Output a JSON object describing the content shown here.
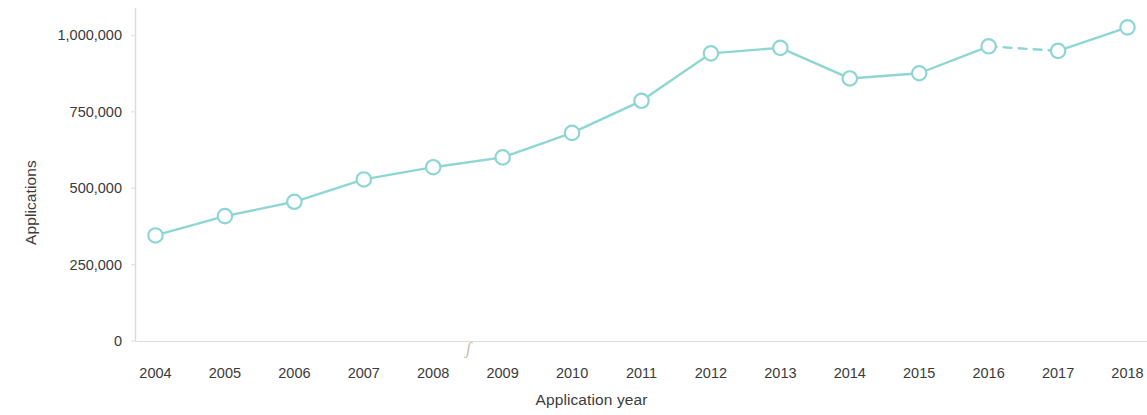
{
  "chart_data": {
    "type": "line",
    "title": "",
    "xlabel": "Application year",
    "ylabel": "Applications",
    "categories": [
      "2004",
      "2005",
      "2006",
      "2007",
      "2008",
      "2009",
      "2010",
      "2011",
      "2012",
      "2013",
      "2014",
      "2015",
      "2016",
      "2017",
      "2018"
    ],
    "x": [
      2004,
      2005,
      2006,
      2007,
      2008,
      2009,
      2010,
      2011,
      2012,
      2013,
      2014,
      2015,
      2016,
      2017,
      2018
    ],
    "values": [
      345000,
      408000,
      455000,
      528000,
      568000,
      600000,
      680000,
      785000,
      940000,
      958000,
      858000,
      875000,
      963000,
      948000,
      1025000
    ],
    "series": [
      {
        "name": "Applications",
        "values": [
          345000,
          408000,
          455000,
          528000,
          568000,
          600000,
          680000,
          785000,
          940000,
          958000,
          858000,
          875000,
          963000,
          948000,
          1025000
        ]
      }
    ],
    "ylim": [
      0,
      1075000
    ],
    "xlim": [
      2003.7,
      2018.0
    ],
    "yticks": [
      0,
      250000,
      500000,
      750000,
      1000000
    ],
    "ytick_labels": [
      "0",
      "250,000",
      "500,000",
      "750,000",
      "1,000,000"
    ],
    "xtick_labels": [
      "2004",
      "2005",
      "2006",
      "2007",
      "2008",
      "2009",
      "2010",
      "2011",
      "2012",
      "2013",
      "2014",
      "2015",
      "2016",
      "2017",
      "2018"
    ],
    "grid": false,
    "legend": null,
    "line_color": "#8ed6d4",
    "marker_fill": "#ffffff",
    "marker_edge_color": "#8ed6d4",
    "axis_color": "#d9d9d9",
    "text_color": "#3a3a3a",
    "dashed_segments": [
      [
        2016,
        2017
      ]
    ],
    "annotations": [
      {
        "name": "scan-speck-artifact",
        "text": "ʃ",
        "x": 2008.5,
        "note": "stray scanning artifact above axis"
      }
    ]
  }
}
